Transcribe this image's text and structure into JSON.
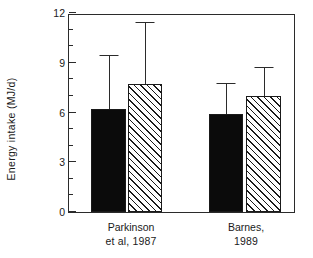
{
  "chart_data": {
    "type": "bar",
    "title": "",
    "subtitle": "",
    "xlabel": "",
    "ylabel": "Energy intake  (MJ/d)",
    "categories": [
      "Parkinson et al, 1987",
      "Barnes, 1989"
    ],
    "ylim": [
      0,
      12
    ],
    "yticks": [
      0,
      3,
      6,
      9,
      12
    ],
    "ytick_labels": [
      "0",
      "3",
      "6",
      "9",
      "12"
    ],
    "yminor_ticks": [
      1,
      2,
      4,
      5,
      7,
      8,
      10,
      11
    ],
    "grid": false,
    "legend": null,
    "error_bar_type": "upper-only",
    "series": [
      {
        "name": "solid-bar",
        "fill": "solid-black",
        "values": [
          6.2,
          5.9
        ],
        "error_upper": [
          9.4,
          7.7
        ]
      },
      {
        "name": "hatched-bar",
        "fill": "diagonal-hatch",
        "values": [
          7.7,
          7.0
        ],
        "error_upper": [
          11.4,
          8.7
        ]
      }
    ]
  },
  "axis": {
    "y_title": "Energy intake  (MJ/d)",
    "tick_0": "0",
    "tick_3": "3",
    "tick_6": "6",
    "tick_9": "9",
    "tick_12": "12"
  },
  "groups": [
    {
      "line1": "Parkinson",
      "line2": "et al, 1987"
    },
    {
      "line1": "Barnes,",
      "line2": "1989"
    }
  ],
  "colors": {
    "axis": "#2b2b2b",
    "solid_bar": "#0b0b0b",
    "hatch_line": "#1a1a1a",
    "background": "#ffffff"
  }
}
